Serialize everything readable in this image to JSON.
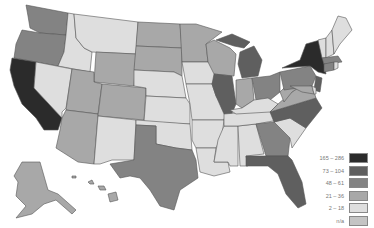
{
  "map": {
    "title": "",
    "classes": {
      "c1": {
        "label": "165 – 286",
        "color": "#2b2b2b"
      },
      "c2": {
        "label": "73 – 104",
        "color": "#5f5f5f"
      },
      "c3": {
        "label": "48 – 61",
        "color": "#838383"
      },
      "c4": {
        "label": "21 – 36",
        "color": "#a8a8a8"
      },
      "c5": {
        "label": "2 – 18",
        "color": "#dedede"
      },
      "na": {
        "label": "n/a",
        "color": "#c4c4c4"
      }
    },
    "states": {
      "CA": "c1",
      "NY": "c1",
      "MI": "c2",
      "IL": "c2",
      "NC": "c2",
      "FL": "c2",
      "NJ": "c2",
      "TX": "c3",
      "PA": "c3",
      "OH": "c3",
      "MA": "c3",
      "GA": "c3",
      "OR": "c3",
      "WA": "c3",
      "CT": "c3",
      "MN": "c4",
      "WI": "c4",
      "CO": "c4",
      "AZ": "c4",
      "UT": "c4",
      "IN": "c4",
      "VA": "c4",
      "ND": "c4",
      "SD": "c4",
      "WY": "c4",
      "WV": "c4",
      "AK": "c4",
      "HI": "c4",
      "MD": "c4",
      "MT": "c5",
      "ID": "c5",
      "NV": "c5",
      "NM": "c5",
      "NE": "c5",
      "KS": "c5",
      "OK": "c5",
      "IA": "c5",
      "MO": "c5",
      "AR": "c5",
      "LA": "c5",
      "MS": "c5",
      "AL": "c5",
      "TN": "c5",
      "KY": "c5",
      "SC": "c5",
      "ME": "c5",
      "NH": "c5",
      "VT": "c5",
      "DE": "c5",
      "RI": "c5"
    }
  },
  "legend": {
    "items": [
      {
        "label": "165 – 286",
        "color": "#2b2b2b"
      },
      {
        "label": "73 – 104",
        "color": "#5f5f5f"
      },
      {
        "label": "48 – 61",
        "color": "#838383"
      },
      {
        "label": "21 – 36",
        "color": "#a8a8a8"
      },
      {
        "label": "2 – 18",
        "color": "#dedede"
      },
      {
        "label": "n/a",
        "color": "#c4c4c4"
      }
    ]
  }
}
